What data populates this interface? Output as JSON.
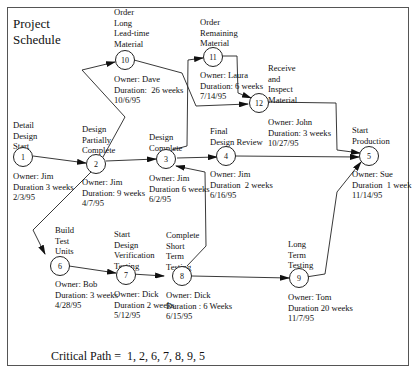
{
  "title": "Project\nSchedule",
  "nodes": [
    {
      "id": "1",
      "label": "Detail\nDesign\nStart",
      "info": "Owner: Jim\nDuration 3 weeks\n2/3/95"
    },
    {
      "id": "2",
      "label": "Design\nPartially\nComplete",
      "info": "Owner: Jim\nDuration: 9 weeks\n4/7/95"
    },
    {
      "id": "3",
      "label": "Design\nComplete",
      "info": "Owner: Jim\nDuration 6 weeks\n6/2/95"
    },
    {
      "id": "4",
      "label": "Final\nDesign Review",
      "info": "Owner: Jim\nDuration  2 weeks\n6/16/95"
    },
    {
      "id": "5",
      "label": "Start\nProduction",
      "info": "Owner: Sue\nDuration  1 week\n11/14/95"
    },
    {
      "id": "6",
      "label": "Build\nTest\nUnits",
      "info": "Owner: Bob\nDuration: 3 weeks\n4/28/95"
    },
    {
      "id": "7",
      "label": "Start\nDesign\nVerification\nTesting",
      "info": "Owner: Dick\nDuration 2 weeks\n5/12/95"
    },
    {
      "id": "8",
      "label": "Complete\nShort\nTerm\nTesting",
      "info": "Owner: Dick\nDuration : 6 Weeks\n6/15/95"
    },
    {
      "id": "9",
      "label": "Long\nTerm\nTesting",
      "info": "Owner: Tom\nDuration 20 weeks\n11/7/95"
    },
    {
      "id": "10",
      "label": "Order\nLong\nLead-time\nMaterial",
      "info": "Owner: Dave\nDuration:  26 weeks\n10/6/95"
    },
    {
      "id": "11",
      "label": "Order\nRemaining\nMaterial",
      "info": "Owner: Laura\nDuration: 6 weeks\n7/14/95"
    },
    {
      "id": "12",
      "label": "Receive\nand\nInspect\nMaterial",
      "info": "Owner: John\nDuration: 3 weeks\n10/27/95"
    }
  ],
  "edges": [
    [
      "1",
      "2"
    ],
    [
      "2",
      "10"
    ],
    [
      "2",
      "3"
    ],
    [
      "2",
      "6"
    ],
    [
      "3",
      "11"
    ],
    [
      "3",
      "4"
    ],
    [
      "10",
      "12"
    ],
    [
      "11",
      "12"
    ],
    [
      "12",
      "5"
    ],
    [
      "4",
      "5"
    ],
    [
      "6",
      "7"
    ],
    [
      "7",
      "8"
    ],
    [
      "8",
      "3"
    ],
    [
      "8",
      "9"
    ],
    [
      "9",
      "5"
    ]
  ],
  "critical_path": "Critical Path =  1, 2, 6, 7, 8, 9, 5"
}
